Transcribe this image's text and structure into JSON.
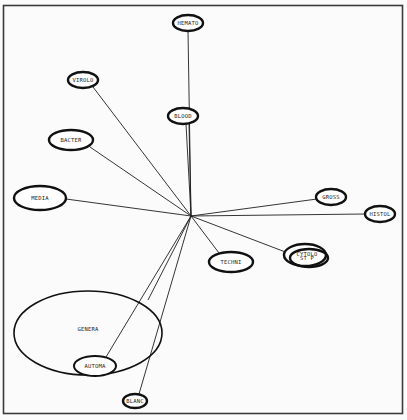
{
  "diagram": {
    "type": "star-network-map",
    "hub": {
      "x": 191,
      "y": 216
    },
    "nodes": [
      {
        "id": "hemato",
        "label": "HEMATO",
        "x": 188,
        "y": 23,
        "rx": 15,
        "ry": 8,
        "style": "bold"
      },
      {
        "id": "virolo",
        "label": "VIROLO",
        "x": 83,
        "y": 80,
        "rx": 15,
        "ry": 8,
        "style": "bold"
      },
      {
        "id": "blood",
        "label": "BLOOD",
        "x": 183,
        "y": 116,
        "rx": 15,
        "ry": 8,
        "style": "bold"
      },
      {
        "id": "bacter",
        "label": "BACTER",
        "x": 71,
        "y": 140,
        "rx": 22,
        "ry": 10,
        "style": "bold"
      },
      {
        "id": "media",
        "label": "MEDIA",
        "x": 40,
        "y": 198,
        "rx": 26,
        "ry": 12,
        "style": "bold"
      },
      {
        "id": "gross",
        "label": "GROSS",
        "x": 331,
        "y": 197,
        "rx": 15,
        "ry": 8,
        "style": "bold"
      },
      {
        "id": "histol",
        "label": "HISTOL",
        "x": 380,
        "y": 214,
        "rx": 15,
        "ry": 8,
        "style": "bold"
      },
      {
        "id": "cytolo",
        "label": "CYTOLO / ST P",
        "x": 307,
        "y": 256,
        "rx": 21,
        "ry": 11,
        "style": "double"
      },
      {
        "id": "techni",
        "label": "TECHNI",
        "x": 231,
        "y": 262,
        "rx": 22,
        "ry": 10,
        "style": "bold"
      },
      {
        "id": "genera",
        "label": "GENERA",
        "x": 88,
        "y": 333,
        "rx": 74,
        "ry": 42,
        "style": "thin"
      },
      {
        "id": "automa",
        "label": "AUTOMA",
        "x": 95,
        "y": 366,
        "rx": 21,
        "ry": 10,
        "style": "thin"
      },
      {
        "id": "blanc",
        "label": "BLANC",
        "x": 135,
        "y": 401,
        "rx": 12,
        "ry": 7,
        "style": "bold"
      }
    ],
    "edges": [
      {
        "to": "hemato",
        "x2": 188,
        "y2": 31
      },
      {
        "to": "blood",
        "x2": 186,
        "y2": 124
      },
      {
        "to": "blood-2",
        "x2": 189,
        "y2": 124
      },
      {
        "to": "virolo",
        "x2": 93,
        "y2": 87
      },
      {
        "to": "bacter",
        "x2": 90,
        "y2": 147
      },
      {
        "to": "media",
        "x2": 66,
        "y2": 199
      },
      {
        "to": "gross",
        "x2": 317,
        "y2": 199
      },
      {
        "to": "histol",
        "x2": 365,
        "y2": 214
      },
      {
        "to": "cytolo",
        "x2": 288,
        "y2": 253
      },
      {
        "to": "techni",
        "x2": 219,
        "y2": 253
      },
      {
        "to": "genera",
        "x2": 148,
        "y2": 300
      },
      {
        "to": "automa",
        "x2": 106,
        "y2": 357
      },
      {
        "to": "blanc",
        "x2": 139,
        "y2": 394
      }
    ]
  }
}
